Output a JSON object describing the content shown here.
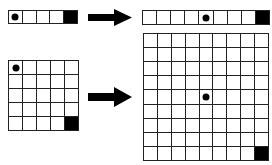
{
  "diagram": {
    "panels": [
      {
        "id": "top-left-strip",
        "rows": 1,
        "cols": 5,
        "dot": [
          0,
          0
        ],
        "goal": [
          0,
          4
        ]
      },
      {
        "id": "top-right-strip",
        "rows": 1,
        "cols": 9,
        "dot": [
          0,
          4
        ],
        "goal": [
          0,
          8
        ]
      },
      {
        "id": "bottom-left-grid",
        "rows": 5,
        "cols": 5,
        "dot": [
          0,
          0
        ],
        "goal": [
          4,
          4
        ]
      },
      {
        "id": "bottom-right-grid",
        "rows": 9,
        "cols": 9,
        "dot": [
          4,
          4
        ],
        "goal": [
          8,
          8
        ]
      }
    ],
    "arrows": [
      {
        "from": "top-left-strip",
        "to": "top-right-strip"
      },
      {
        "from": "bottom-left-grid",
        "to": "bottom-right-grid"
      }
    ],
    "colors": {
      "line": "#222222",
      "fill": "#000000",
      "background": "#ffffff"
    }
  }
}
